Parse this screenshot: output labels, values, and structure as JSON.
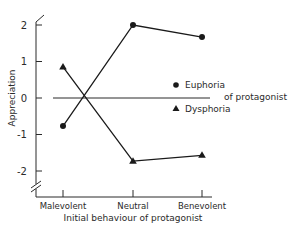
{
  "chart_data": {
    "type": "line",
    "title": "",
    "xlabel": "Initial behaviour of protagonist",
    "ylabel": "Appreciation",
    "categories": [
      "Malevolent",
      "Neutral",
      "Benevolent"
    ],
    "ylim": [
      -2.5,
      2.3
    ],
    "yticks": [
      2,
      1,
      0,
      -1,
      -2
    ],
    "ytick_labels": [
      "2",
      "1",
      "0",
      "-1",
      "-2"
    ],
    "axis_break": "y-axis below -2",
    "reference_line": 0,
    "grid": false,
    "legend": {
      "placement": "right",
      "group_label": "of protagonist",
      "entries": [
        {
          "name": "Euphoria",
          "marker": "circle"
        },
        {
          "name": "Dysphoria",
          "marker": "triangle"
        }
      ]
    },
    "series": [
      {
        "name": "Euphoria",
        "marker": "circle",
        "values": [
          -0.77,
          2.0,
          1.67
        ]
      },
      {
        "name": "Dysphoria",
        "marker": "triangle",
        "values": [
          0.85,
          -1.73,
          -1.57
        ]
      }
    ],
    "colors": {
      "ink": "#1a1a1a",
      "background": "#ffffff"
    }
  }
}
